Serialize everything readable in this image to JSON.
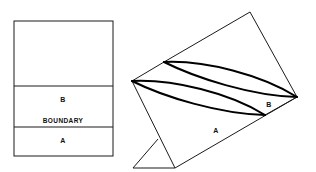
{
  "figure": {
    "background_color": "#ffffff",
    "line_color": "#1a1a1a",
    "emphasis_line_color": "#000000",
    "text_color": "#111111",
    "width": 316,
    "height": 172
  },
  "left_panel": {
    "name": "cross-section-view",
    "rect": {
      "x": 14,
      "y": 21,
      "width": 99,
      "height": 135
    },
    "divider_top_y": 86,
    "divider_bottom_y": 127,
    "regions": [
      {
        "id": "upper-blank",
        "label": ""
      },
      {
        "id": "region-b",
        "label": "B",
        "label_x": 63,
        "label_y": 100
      },
      {
        "id": "boundary",
        "label": "BOUNDARY",
        "label_x": 63,
        "label_y": 121
      },
      {
        "id": "region-a",
        "label": "A",
        "label_x": 63,
        "label_y": 140
      }
    ]
  },
  "right_panel": {
    "name": "perspective-view",
    "labels": [
      {
        "id": "region-a-label",
        "text": "A",
        "x": 216,
        "y": 130
      },
      {
        "id": "region-b-label",
        "text": "B",
        "x": 269,
        "y": 104
      }
    ],
    "vertices": {
      "top_apex": {
        "x": 250,
        "y": 12
      },
      "upper_left": {
        "x": 164,
        "y": 62
      },
      "left": {
        "x": 132,
        "y": 81
      },
      "right": {
        "x": 297,
        "y": 97
      },
      "lower_mid_right": {
        "x": 265,
        "y": 115
      },
      "lower_left": {
        "x": 175,
        "y": 168
      },
      "foot_left": {
        "x": 133,
        "y": 168
      },
      "foot_stem": {
        "x": 158,
        "y": 139
      }
    },
    "lens_count": 2
  }
}
